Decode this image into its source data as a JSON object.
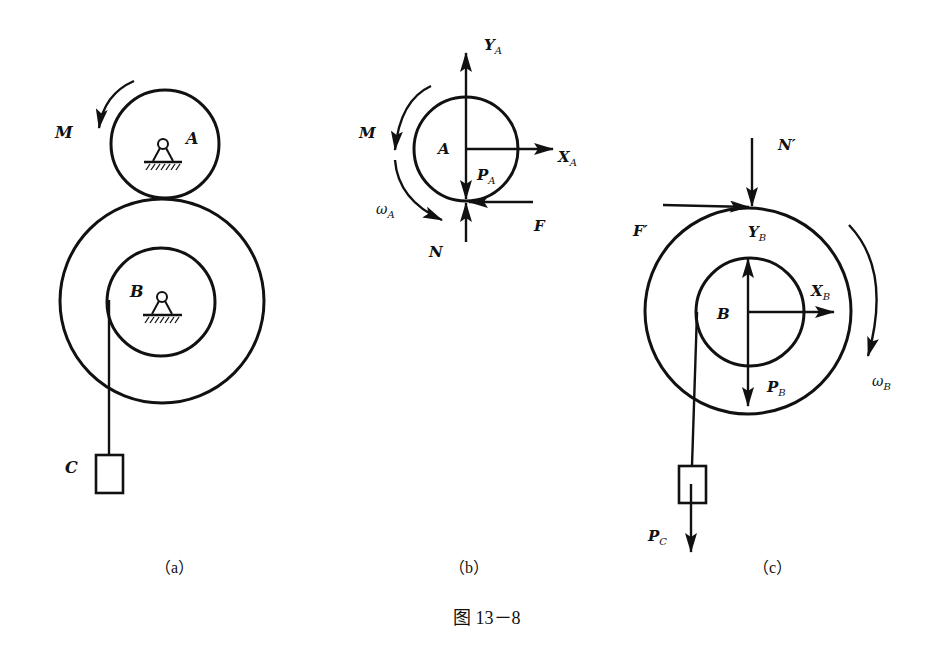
{
  "figure": {
    "caption": "图 13－8",
    "panels": {
      "a": {
        "label": "（a）",
        "wheel_A": "A",
        "wheel_B": "B",
        "block_C": "C",
        "moment": "M"
      },
      "b": {
        "label": "（b）",
        "center": "A",
        "moment": "M",
        "omega": "ω",
        "omega_sub": "A",
        "Y": "Y",
        "Y_sub": "A",
        "X": "X",
        "X_sub": "A",
        "P": "P",
        "P_sub": "A",
        "N": "N",
        "F": "F"
      },
      "c": {
        "label": "（c）",
        "center": "B",
        "N_prime": "N′",
        "F_prime": "F′",
        "Y": "Y",
        "Y_sub": "B",
        "X": "X",
        "X_sub": "B",
        "P": "P",
        "P_sub": "B",
        "omega": "ω",
        "omega_sub": "B",
        "PC": "P",
        "PC_sub": "C"
      }
    }
  },
  "colors": {
    "ink": "#111111",
    "background": "#ffffff"
  }
}
